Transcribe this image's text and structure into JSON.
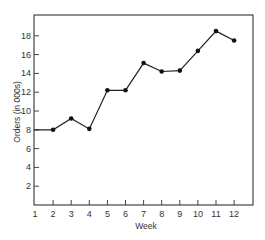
{
  "chart_data": {
    "type": "line",
    "title": "",
    "xlabel": "Week",
    "ylabel": "Orders (in 000s)",
    "x": [
      1,
      2,
      3,
      4,
      5,
      6,
      7,
      8,
      9,
      10,
      11,
      12
    ],
    "categories": [
      "1",
      "2",
      "3",
      "4",
      "5",
      "6",
      "7",
      "8",
      "9",
      "10",
      "11",
      "12"
    ],
    "series": [
      {
        "name": "Orders",
        "values": [
          8,
          8,
          9.2,
          8.1,
          12.2,
          12.2,
          15.1,
          14.2,
          14.3,
          16.4,
          18.5,
          17.5
        ]
      }
    ],
    "values": [
      8,
      8,
      9.2,
      8.1,
      12.2,
      12.2,
      15.1,
      14.2,
      14.3,
      16.4,
      18.5,
      17.5
    ],
    "ylim": [
      0,
      20
    ],
    "xlim": [
      1,
      13
    ],
    "yticks": [
      2,
      4,
      6,
      8,
      10,
      12,
      14,
      16,
      18
    ],
    "xticks": [
      1,
      2,
      3,
      4,
      5,
      6,
      7,
      8,
      9,
      10,
      11,
      12
    ],
    "grid": false,
    "legend": null,
    "markers": "filled-circle",
    "line_color": "#222222",
    "frame": "box"
  }
}
